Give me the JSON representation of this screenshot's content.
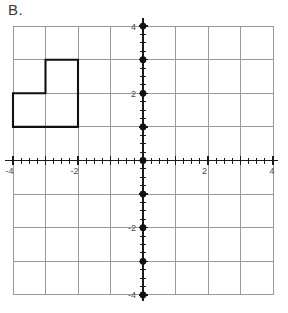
{
  "problem": {
    "label": "B."
  },
  "chart_data": {
    "type": "scatter",
    "title": "",
    "xlabel": "",
    "ylabel": "",
    "xlim": [
      -4,
      4
    ],
    "ylim": [
      -4,
      4
    ],
    "grid": true,
    "legend_position": "none",
    "grid_step": 1,
    "minor_tick_step": 0.25,
    "x_ticks": [
      -4,
      -3,
      -2,
      -1,
      0,
      1,
      2,
      3,
      4
    ],
    "y_ticks": [
      -4,
      -3,
      -2,
      -1,
      0,
      1,
      2,
      3,
      4
    ],
    "x_tick_labels": [
      "-4",
      "",
      "-2",
      "",
      "",
      "",
      "2",
      "",
      "4"
    ],
    "y_tick_labels": [
      "-4",
      "",
      "-2",
      "",
      "",
      "",
      "2",
      "",
      "4"
    ],
    "series": [
      {
        "name": "y-axis integer points",
        "type": "scatter",
        "marker": "filled-circle",
        "color": "#111111",
        "points": [
          {
            "x": 0,
            "y": 4
          },
          {
            "x": 0,
            "y": 3
          },
          {
            "x": 0,
            "y": 2
          },
          {
            "x": 0,
            "y": 1
          },
          {
            "x": 0,
            "y": 0
          },
          {
            "x": 0,
            "y": -1
          },
          {
            "x": 0,
            "y": -2
          },
          {
            "x": 0,
            "y": -3
          },
          {
            "x": 0,
            "y": -4
          }
        ]
      },
      {
        "name": "L-shaped figure",
        "type": "polygon",
        "color": "#111111",
        "fill": "none",
        "vertices": [
          {
            "x": -4,
            "y": 2
          },
          {
            "x": -3,
            "y": 2
          },
          {
            "x": -3,
            "y": 3
          },
          {
            "x": -2,
            "y": 3
          },
          {
            "x": -2,
            "y": 1
          },
          {
            "x": -4,
            "y": 1
          }
        ]
      }
    ],
    "colors": {
      "grid": "#9a9a9a",
      "axis": "#1a1a1a",
      "shape": "#111111",
      "background": "#ffffff"
    }
  }
}
